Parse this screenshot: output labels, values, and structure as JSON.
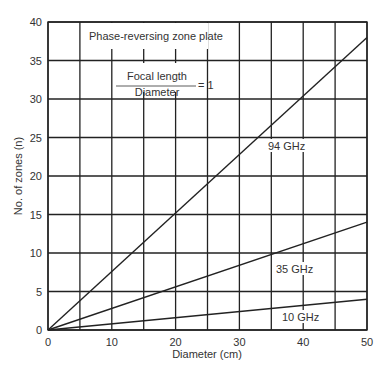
{
  "chart_data": {
    "type": "line",
    "title": "Phase-reversing zone plate",
    "annotation": {
      "numerator": "Focal length",
      "denominator": "Diameter",
      "equals": "= 1"
    },
    "xlabel": "Diameter (cm)",
    "ylabel": "No. of zones (n)",
    "xlim": [
      0,
      50
    ],
    "ylim": [
      0,
      40
    ],
    "x_ticks": [
      "0",
      "10",
      "20",
      "30",
      "40",
      "50"
    ],
    "y_ticks": [
      "0",
      "5",
      "10",
      "15",
      "20",
      "25",
      "30",
      "35",
      "40"
    ],
    "grid": true,
    "grid_step": 5,
    "x": [
      0,
      50
    ],
    "series": [
      {
        "name": "94 GHz",
        "values": [
          0,
          38
        ]
      },
      {
        "name": "35 GHz",
        "values": [
          0,
          14
        ]
      },
      {
        "name": "10 GHz",
        "values": [
          0,
          4
        ]
      }
    ],
    "series_labels": [
      "94 GHz",
      "35 GHz",
      "10 GHz"
    ]
  }
}
